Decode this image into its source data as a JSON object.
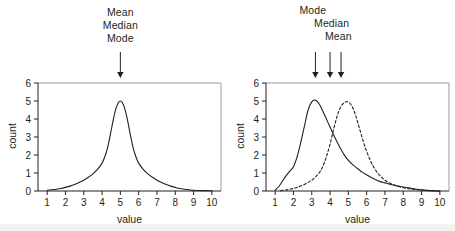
{
  "figure": {
    "background_color": "#ffffff",
    "line_color": "#231f20",
    "frame_color": "#9a9a9a"
  },
  "panels": [
    {
      "id": "left",
      "annotations": [
        {
          "name": "mean",
          "label": "Mean",
          "value": 5.0
        },
        {
          "name": "median",
          "label": "Median",
          "value": 5.0
        },
        {
          "name": "mode",
          "label": "Mode",
          "value": 5.0
        }
      ],
      "arrows": [
        {
          "name": "center-arrow",
          "value": 5.0
        }
      ],
      "chart_data": {
        "type": "line",
        "title": "",
        "xlabel": "value",
        "ylabel": "count",
        "xlim": [
          0.5,
          10.5
        ],
        "ylim": [
          0,
          6
        ],
        "xticks": [
          1,
          2,
          3,
          4,
          5,
          6,
          7,
          8,
          9,
          10
        ],
        "yticks": [
          0,
          1,
          2,
          3,
          4,
          5,
          6
        ],
        "grid": false,
        "legend": "none",
        "series": [
          {
            "name": "symmetric-distribution",
            "style": "solid",
            "peak_x": 5.0,
            "peak_y": 5.0,
            "x": [
              1.0,
              1.25,
              1.5,
              1.75,
              2.0,
              2.25,
              2.5,
              2.75,
              3.0,
              3.25,
              3.5,
              3.75,
              4.0,
              4.15,
              4.3,
              4.45,
              4.6,
              4.75,
              4.9,
              5.0,
              5.1,
              5.25,
              5.4,
              5.55,
              5.7,
              5.85,
              6.0,
              6.25,
              6.5,
              6.75,
              7.0,
              7.25,
              7.5,
              7.75,
              8.0,
              8.25,
              8.5,
              8.75,
              9.0,
              9.5,
              10.0
            ],
            "values": [
              0.04,
              0.07,
              0.1,
              0.14,
              0.2,
              0.27,
              0.36,
              0.47,
              0.6,
              0.76,
              0.95,
              1.2,
              1.55,
              1.9,
              2.4,
              3.1,
              3.9,
              4.55,
              4.93,
              5.0,
              4.93,
              4.55,
              3.9,
              3.1,
              2.4,
              1.9,
              1.55,
              1.2,
              0.95,
              0.76,
              0.6,
              0.47,
              0.36,
              0.27,
              0.2,
              0.14,
              0.1,
              0.07,
              0.04,
              0.02,
              0.01
            ]
          }
        ]
      }
    },
    {
      "id": "right",
      "annotations": [
        {
          "name": "mode",
          "label": "Mode",
          "value": 3.2
        },
        {
          "name": "median",
          "label": "Median",
          "value": 4.0
        },
        {
          "name": "mean",
          "label": "Mean",
          "value": 4.6
        }
      ],
      "arrows": [
        {
          "name": "mode-arrow",
          "value": 3.2
        },
        {
          "name": "median-arrow",
          "value": 4.0
        },
        {
          "name": "mean-arrow",
          "value": 4.6
        }
      ],
      "chart_data": {
        "type": "line",
        "title": "",
        "xlabel": "value",
        "ylabel": "count",
        "xlim": [
          0.5,
          10.5
        ],
        "ylim": [
          0,
          6
        ],
        "xticks": [
          1,
          2,
          3,
          4,
          5,
          6,
          7,
          8,
          9,
          10
        ],
        "yticks": [
          0,
          1,
          2,
          3,
          4,
          5,
          6
        ],
        "grid": false,
        "legend": "none",
        "series": [
          {
            "name": "skewed-distribution",
            "style": "solid",
            "peak_x": 3.2,
            "peak_y": 5.05,
            "x": [
              1.0,
              1.2,
              1.4,
              1.6,
              1.8,
              2.0,
              2.2,
              2.4,
              2.6,
              2.8,
              3.0,
              3.2,
              3.4,
              3.6,
              3.8,
              4.0,
              4.25,
              4.5,
              4.75,
              5.0,
              5.25,
              5.5,
              5.75,
              6.0,
              6.25,
              6.5,
              6.75,
              7.0,
              7.25,
              7.5,
              7.75,
              8.0,
              8.25,
              8.5,
              8.75,
              9.0,
              9.5,
              10.0
            ],
            "values": [
              0.05,
              0.25,
              0.55,
              0.85,
              1.1,
              1.35,
              1.9,
              2.7,
              3.6,
              4.5,
              4.95,
              5.05,
              4.85,
              4.45,
              4.0,
              3.55,
              3.0,
              2.5,
              2.05,
              1.7,
              1.45,
              1.25,
              1.05,
              0.9,
              0.75,
              0.62,
              0.52,
              0.45,
              0.38,
              0.32,
              0.27,
              0.22,
              0.18,
              0.14,
              0.1,
              0.06,
              0.02,
              0.0
            ]
          },
          {
            "name": "symmetric-distribution",
            "style": "dashed",
            "peak_x": 5.0,
            "peak_y": 4.95,
            "x": [
              1.3,
              1.6,
              1.9,
              2.2,
              2.5,
              2.8,
              3.0,
              3.2,
              3.4,
              3.6,
              3.8,
              4.0,
              4.2,
              4.4,
              4.6,
              4.8,
              5.0,
              5.2,
              5.4,
              5.6,
              5.8,
              6.0,
              6.2,
              6.4,
              6.6,
              6.8,
              7.0,
              7.3,
              7.6,
              8.0,
              8.4,
              8.8,
              9.2,
              9.6,
              10.0
            ],
            "values": [
              0.02,
              0.06,
              0.12,
              0.2,
              0.32,
              0.48,
              0.6,
              0.78,
              1.0,
              1.35,
              1.9,
              2.6,
              3.45,
              4.2,
              4.7,
              4.92,
              4.95,
              4.7,
              4.2,
              3.5,
              2.8,
              2.2,
              1.7,
              1.3,
              1.0,
              0.78,
              0.6,
              0.42,
              0.3,
              0.18,
              0.11,
              0.07,
              0.04,
              0.02,
              0.0
            ]
          }
        ]
      }
    }
  ]
}
